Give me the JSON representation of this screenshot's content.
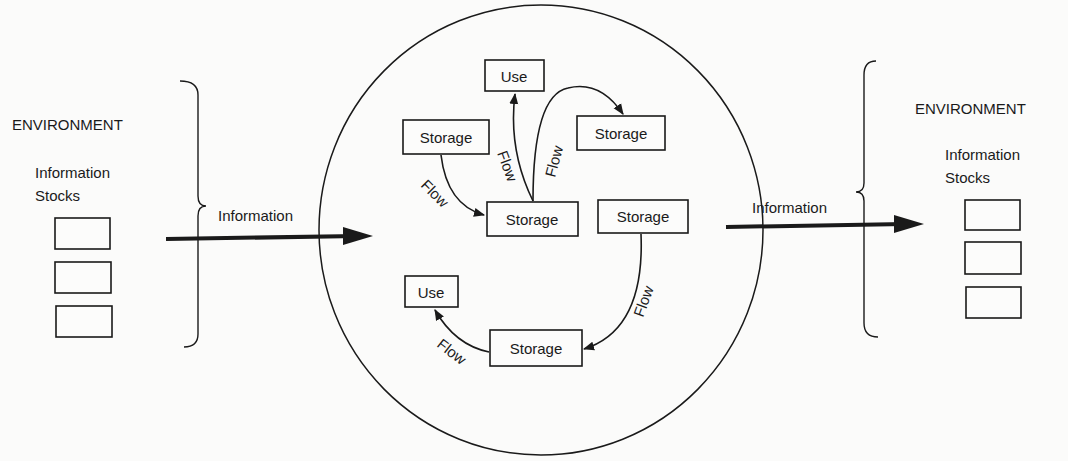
{
  "left_environment": {
    "title": "ENVIRONMENT",
    "stocks_label_line1": "Information",
    "stocks_label_line2": "Stocks",
    "stock_boxes": 3
  },
  "right_environment": {
    "title": "ENVIRONMENT",
    "stocks_label_line1": "Information",
    "stocks_label_line2": "Stocks",
    "stock_boxes": 3
  },
  "input_arrow": {
    "label": "Information"
  },
  "output_arrow": {
    "label": "Information"
  },
  "system": {
    "nodes": [
      {
        "id": "use-top",
        "label": "Use"
      },
      {
        "id": "storage-top-left",
        "label": "Storage"
      },
      {
        "id": "storage-top-right",
        "label": "Storage"
      },
      {
        "id": "storage-center",
        "label": "Storage"
      },
      {
        "id": "storage-right",
        "label": "Storage"
      },
      {
        "id": "use-bottom",
        "label": "Use"
      },
      {
        "id": "storage-bottom",
        "label": "Storage"
      }
    ],
    "flows": [
      {
        "from": "storage-top-left",
        "to": "storage-center",
        "label": "Flow"
      },
      {
        "from": "storage-center",
        "to": "use-top",
        "label": "Flow"
      },
      {
        "from": "storage-center",
        "to": "storage-top-right",
        "label": "Flow"
      },
      {
        "from": "storage-right",
        "to": "storage-bottom",
        "label": "Flow"
      },
      {
        "from": "storage-bottom",
        "to": "use-bottom",
        "label": "Flow"
      }
    ]
  }
}
